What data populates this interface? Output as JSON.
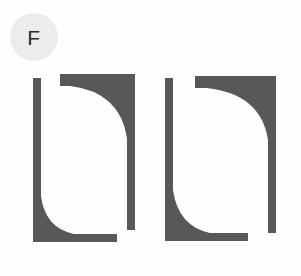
{
  "figure": {
    "panel_label": "F",
    "background_color": "#fefefe",
    "badge_color": "#ececec",
    "shape_color": "#585858",
    "width": 301,
    "height": 276
  },
  "shapes": [
    {
      "name": "left-l-shape",
      "role": "vertical-bar-with-concave-fillet-and-base",
      "path": "M 33 78 L 41 78 L 41 196 Q 45 228 74 234 L 117 234 L 117 242 L 33 242 Z"
    },
    {
      "name": "left-hook-shape",
      "role": "horizontal-top-bar-with-concave-fillet-and-tail",
      "path": "M 60 74 L 135 74 L 135 230 L 127 230 L 127 138 Q 120 92 70 86 L 60 86 Z"
    },
    {
      "name": "right-l-shape",
      "role": "vertical-bar-with-concave-fillet-and-base",
      "path": "M 165 78 L 173 78 L 173 190 Q 178 226 210 233 L 248 233 L 248 241 L 165 241 Z"
    },
    {
      "name": "right-hook-shape",
      "role": "horizontal-top-bar-with-concave-fillet-and-tail",
      "path": "M 195 76 L 276 76 L 276 233 L 268 233 L 268 140 Q 261 94 207 88 L 195 88 Z"
    }
  ]
}
